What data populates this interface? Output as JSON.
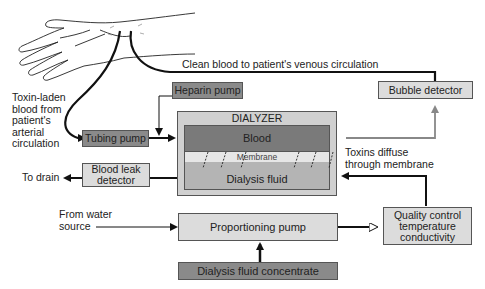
{
  "diagram": {
    "labels": {
      "toxin_laden": [
        "Toxin-laden",
        "blood from",
        "patient's",
        "arterial",
        "circulation"
      ],
      "clean_blood": "Clean blood to patient's venous circulation",
      "toxins_diffuse": [
        "Toxins diffuse",
        "through membrane"
      ],
      "to_drain": "To drain",
      "from_water": [
        "From water",
        "source"
      ]
    },
    "boxes": {
      "heparin_pump": "Heparin pump",
      "tubing_pump": "Tubing pump",
      "bubble_detector": "Bubble detector",
      "dialyzer_title": "DIALYZER",
      "blood": "Blood",
      "membrane": "Membrane",
      "dialysis_fluid": "Dialysis fluid",
      "blood_leak_detector": [
        "Blood leak",
        "detector"
      ],
      "proportioning_pump": "Proportioning pump",
      "quality_control": [
        "Quality control",
        "temperature",
        "conductivity"
      ],
      "dialysis_fluid_concentrate": "Dialysis fluid concentrate"
    },
    "colors": {
      "dark_box": "#8a8a8a",
      "light_box": "#dcdcdc",
      "blood": "#7a7a7a",
      "membrane": "#e6e6e6",
      "fluid": "#b4b4b4",
      "dialyzer_outer": "#d0d0d0",
      "line": "#111111",
      "gray_line": "#888888"
    }
  }
}
